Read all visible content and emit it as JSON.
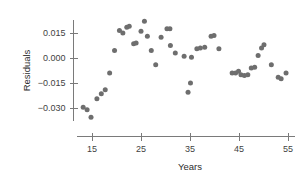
{
  "chart_data": {
    "type": "scatter",
    "title": "",
    "xlabel": "Years",
    "ylabel": "Residuals",
    "xlim": [
      12,
      56.5
    ],
    "ylim": [
      -0.038,
      0.023
    ],
    "xticks": [
      15,
      25,
      35,
      45,
      55
    ],
    "xtick_labels": [
      "15",
      "25",
      "35",
      "45",
      "55"
    ],
    "yticks": [
      0.015,
      0.0,
      -0.015,
      -0.03
    ],
    "ytick_labels": [
      "0.015",
      "0.000",
      "−0.015",
      "−0.030"
    ],
    "grid": false,
    "legend": null,
    "marker_color": "#6e6e6e",
    "axis_color": "#7a7a7a",
    "series": [
      {
        "name": "residuals",
        "points": [
          [
            13.2,
            -0.0295
          ],
          [
            14.0,
            -0.031
          ],
          [
            14.8,
            -0.0355
          ],
          [
            16.0,
            -0.0245
          ],
          [
            16.9,
            -0.0215
          ],
          [
            17.7,
            -0.019
          ],
          [
            18.6,
            -0.009
          ],
          [
            19.6,
            0.0045
          ],
          [
            20.6,
            0.0165
          ],
          [
            21.3,
            0.015
          ],
          [
            22.1,
            0.0185
          ],
          [
            22.6,
            0.019
          ],
          [
            23.5,
            0.0085
          ],
          [
            24.0,
            0.009
          ],
          [
            25.0,
            0.016
          ],
          [
            25.7,
            0.022
          ],
          [
            26.3,
            0.013
          ],
          [
            27.1,
            0.0045
          ],
          [
            28.0,
            -0.004
          ],
          [
            29.1,
            0.0125
          ],
          [
            30.3,
            0.0175
          ],
          [
            30.9,
            0.0175
          ],
          [
            31.0,
            0.0075
          ],
          [
            32.0,
            0.003
          ],
          [
            33.8,
            0.001
          ],
          [
            34.6,
            -0.0205
          ],
          [
            35.1,
            -0.015
          ],
          [
            35.3,
            0.0005
          ],
          [
            36.4,
            0.0055
          ],
          [
            37.1,
            0.006
          ],
          [
            38.0,
            0.0065
          ],
          [
            39.3,
            0.013
          ],
          [
            39.9,
            0.0135
          ],
          [
            40.9,
            0.0055
          ],
          [
            43.6,
            -0.009
          ],
          [
            44.3,
            -0.009
          ],
          [
            44.9,
            -0.008
          ],
          [
            45.4,
            -0.01
          ],
          [
            46.1,
            -0.0105
          ],
          [
            46.8,
            -0.01
          ],
          [
            47.5,
            -0.006
          ],
          [
            48.2,
            -0.0055
          ],
          [
            48.9,
            0.0015
          ],
          [
            49.6,
            0.006
          ],
          [
            50.1,
            0.008
          ],
          [
            51.6,
            -0.004
          ],
          [
            53.0,
            -0.0115
          ],
          [
            53.6,
            -0.0125
          ],
          [
            54.6,
            -0.009
          ]
        ]
      }
    ]
  }
}
